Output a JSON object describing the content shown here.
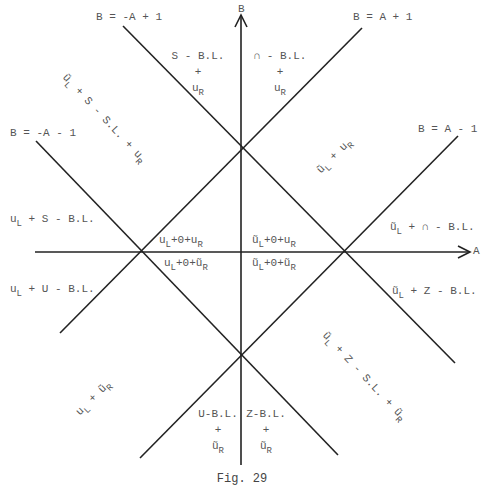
{
  "figure": {
    "caption": "Fig. 29",
    "axes": {
      "x_label": "A",
      "y_label": "B"
    },
    "lines": [
      {
        "id": "l1",
        "label": "B = -A + 1"
      },
      {
        "id": "l2",
        "label": "B = A + 1"
      },
      {
        "id": "l3",
        "label": "B = -A - 1"
      },
      {
        "id": "l4",
        "label": "B = A - 1"
      }
    ],
    "regions": {
      "top_left_stack": {
        "line1": "S - B.L.",
        "line2": "+",
        "line3_main": "u",
        "line3_sub": "R"
      },
      "top_right_stack": {
        "line1": "∩ - B.L.",
        "line2": "+",
        "line3_main": "u",
        "line3_sub": "R"
      },
      "upper_left_diag": {
        "a_main": "ũ",
        "a_sub": "L",
        "rest": " + S - S.L. + ",
        "b_main": "u",
        "b_sub": "R"
      },
      "upper_right_diag": {
        "a_main": "ũ",
        "a_sub": "L",
        "rest": " + ",
        "b_main": "u",
        "b_sub": "R"
      },
      "left_upper": {
        "main": "u",
        "sub": "L",
        "rest": " + S - B.L."
      },
      "left_lower": {
        "main": "u",
        "sub": "L",
        "rest": " + U - B.L."
      },
      "right_upper": {
        "main": "ũ",
        "sub": "L",
        "rest": " + ∩ - B.L."
      },
      "right_lower": {
        "main": "ũ",
        "sub": "L",
        "rest": " + Z - B.L."
      },
      "center_q2": {
        "a_main": "u",
        "a_sub": "L",
        "mid": "+0+",
        "b_main": "u",
        "b_sub": "R"
      },
      "center_q1": {
        "a_main": "ũ",
        "a_sub": "L",
        "mid": "+0+",
        "b_main": "u",
        "b_sub": "R"
      },
      "center_q3": {
        "a_main": "u",
        "a_sub": "L",
        "mid": "+0+",
        "b_main": "ũ",
        "b_sub": "R"
      },
      "center_q4": {
        "a_main": "ũ",
        "a_sub": "L",
        "mid": "+0+",
        "b_main": "ũ",
        "b_sub": "R"
      },
      "lower_left_diag": {
        "a_main": "u",
        "a_sub": "L",
        "rest": " + ",
        "b_main": "ũ",
        "b_sub": "R"
      },
      "lower_right_diag": {
        "a_main": "ũ",
        "a_sub": "L",
        "rest": " + Z - S.L. + ",
        "b_main": "ũ",
        "b_sub": "R"
      },
      "bottom_left_stack": {
        "line1": "U-B.L.",
        "line2": "+",
        "line3_main": "ũ",
        "line3_sub": "R"
      },
      "bottom_right_stack": {
        "line1": "Z-B.L.",
        "line2": "+",
        "line3_main": "ũ",
        "line3_sub": "R"
      }
    },
    "colors": {
      "line": "#222222",
      "text": "#555555",
      "background": "#ffffff"
    }
  }
}
